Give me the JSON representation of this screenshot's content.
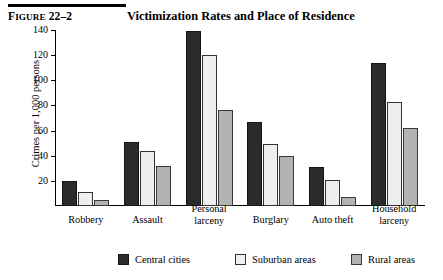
{
  "figure": {
    "number_prefix": "F",
    "number_smallcaps": "IGURE",
    "number_value": " 22–2",
    "number_full": "Figure 22–2",
    "title": "Victimization Rates and Place of Residence"
  },
  "chart_data": {
    "type": "bar",
    "title": "Victimization Rates and Place of Residence",
    "xlabel": "",
    "ylabel": "Crimes per 1,000 persons",
    "ylim": [
      0,
      140
    ],
    "yticks": [
      20,
      40,
      60,
      80,
      100,
      120,
      140
    ],
    "ytick_labels": [
      "20",
      "40",
      "60",
      "80",
      "100",
      "120",
      "140"
    ],
    "grid": false,
    "legend_position": "bottom",
    "categories": [
      "Robbery",
      "Assault",
      "Personal larceny",
      "Burglary",
      "Auto theft",
      "Household larceny"
    ],
    "category_lines": [
      [
        "Robbery"
      ],
      [
        "Assault"
      ],
      [
        "Personal",
        "larceny"
      ],
      [
        "Burglary"
      ],
      [
        "Auto theft"
      ],
      [
        "Household",
        "larceny"
      ]
    ],
    "series": [
      {
        "name": "Central cities",
        "color": "#2b2b2b",
        "values": [
          20,
          51,
          139,
          67,
          31,
          114
        ]
      },
      {
        "name": "Suburban areas",
        "color": "#eeeeee",
        "values": [
          11,
          44,
          120,
          49,
          21,
          83
        ]
      },
      {
        "name": "Rural areas",
        "color": "#b2b2b2",
        "values": [
          5,
          32,
          76,
          40,
          7,
          62
        ]
      }
    ]
  },
  "legend": {
    "items": [
      {
        "label": "Central cities"
      },
      {
        "label": "Suburban areas"
      },
      {
        "label": "Rural areas"
      }
    ]
  }
}
